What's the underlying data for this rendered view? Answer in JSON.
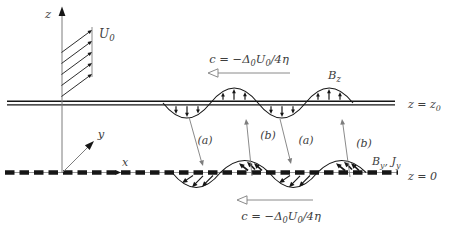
{
  "colors": {
    "background": "#ffffff",
    "ink": "#161616",
    "muted": "#7d7d7d",
    "text": "#3d3d3d"
  },
  "axes": {
    "z_label": "z",
    "y_label": "y",
    "x_label": "x"
  },
  "shear_flow": {
    "label_parts": [
      {
        "t": "U"
      },
      {
        "t": "0",
        "s": true
      }
    ]
  },
  "phase_speed_top": {
    "label_parts": [
      {
        "t": "c = −Δ"
      },
      {
        "t": "0",
        "s": true
      },
      {
        "t": "U"
      },
      {
        "t": "0",
        "s": true
      },
      {
        "t": "/4η"
      }
    ]
  },
  "phase_speed_bottom": {
    "label_parts": [
      {
        "t": "c = −Δ"
      },
      {
        "t": "0",
        "s": true
      },
      {
        "t": "U"
      },
      {
        "t": "0",
        "s": true
      },
      {
        "t": "/4η"
      }
    ]
  },
  "upper_boundary": {
    "line_label_parts": [
      {
        "t": "z = z"
      },
      {
        "t": "0",
        "s": true
      }
    ],
    "field_label_parts": [
      {
        "t": "B"
      },
      {
        "t": "z",
        "s": true
      }
    ]
  },
  "lower_boundary": {
    "line_label_parts": [
      {
        "t": "z = 0"
      }
    ],
    "field_label_parts": [
      {
        "t": "B"
      },
      {
        "t": "y",
        "s": true
      },
      {
        "t": ", J"
      },
      {
        "t": "y",
        "s": true
      }
    ]
  },
  "connectors": [
    {
      "label": "(a)",
      "direction": "down"
    },
    {
      "label": "(b)",
      "direction": "up"
    },
    {
      "label": "(a)",
      "direction": "down"
    },
    {
      "label": "(b)",
      "direction": "up"
    }
  ]
}
